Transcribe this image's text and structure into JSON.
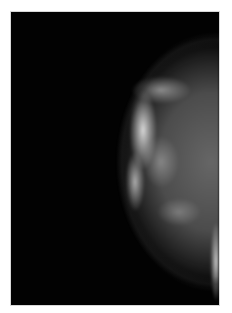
{
  "image": {
    "subject": "mammogram",
    "description": "Grayscale X-ray of breast tissue on a black background, framed by a white border",
    "colors": {
      "background": "#020202",
      "border": "#ffffff",
      "tissue_bright": "#f0f0f0",
      "tissue_mid": "#787878"
    }
  }
}
